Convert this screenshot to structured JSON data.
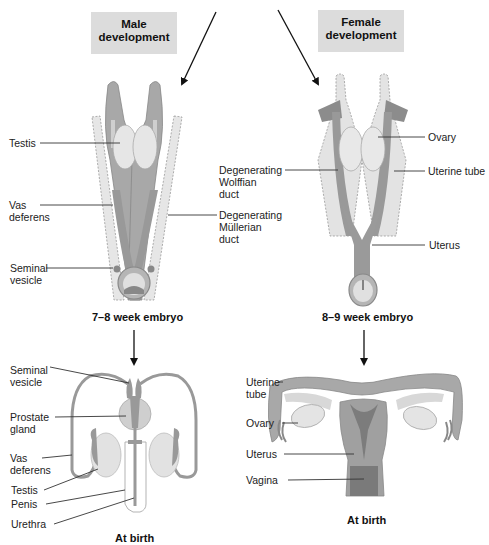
{
  "title_boxes": {
    "male": [
      "Male",
      "development"
    ],
    "female": [
      "Female",
      "development"
    ]
  },
  "male_embryo": {
    "caption": "7–8 week embryo",
    "labels": {
      "testis": "Testis",
      "vas_deferens": [
        "Vas",
        "deferens"
      ],
      "seminal_vesicle": [
        "Seminal",
        "vesicle"
      ]
    }
  },
  "middle_labels": {
    "degenerating_wolffian": [
      "Degenerating",
      "Wolffian",
      "duct"
    ],
    "degenerating_mullerian": [
      "Degenerating",
      "Müllerian",
      "duct"
    ]
  },
  "female_embryo": {
    "caption": "8–9 week embryo",
    "labels": {
      "ovary": "Ovary",
      "uterine_tube": "Uterine tube",
      "uterus": "Uterus"
    }
  },
  "male_birth": {
    "caption": "At birth",
    "labels": {
      "seminal_vesicle": [
        "Seminal",
        "vesicle"
      ],
      "prostate_gland": [
        "Prostate",
        "gland"
      ],
      "vas_deferens": [
        "Vas",
        "deferens"
      ],
      "testis": "Testis",
      "penis": "Penis",
      "urethra": "Urethra"
    }
  },
  "female_birth": {
    "caption": "At birth",
    "labels": {
      "uterine_tube": [
        "Uterine",
        "tube"
      ],
      "ovary": "Ovary",
      "uterus": "Uterus",
      "vagina": "Vagina"
    }
  },
  "colors": {
    "box_fill": "#dcdcdc",
    "tissue_dark": "#8c8c8c",
    "tissue_mid": "#a8a8a8",
    "tissue_light": "#d8d8d8",
    "gonad": "#e4e4e4",
    "leader_line": "#333333"
  }
}
